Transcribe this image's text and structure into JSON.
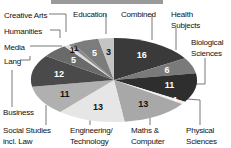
{
  "chart_data": {
    "type": "pie",
    "title": "",
    "categories": [
      "Combined",
      "Health Subjects",
      "Biological Sciences",
      "Physical Sciences",
      "Maths & Computer",
      "Engineering/ Technology",
      "Social Studies incl. Law",
      "Business",
      "Lang",
      "Media",
      "Humanities",
      "Creative Arts",
      "Education"
    ],
    "values": [
      16,
      6,
      11,
      1,
      13,
      13,
      11,
      12,
      5,
      1,
      1,
      5,
      3
    ],
    "colors": [
      "#3a3a3a",
      "#7a7a7a",
      "#2e2e2e",
      "#f0f0f0",
      "#a8a8a8",
      "#e6e6e6",
      "#b0b0b0",
      "#4a4a4a",
      "#6a6a6a",
      "#dcdcdc",
      "#8a8a8a",
      "#7c7c7c",
      "#c4c4c4"
    ],
    "value_label_colors": [
      "#ffffff",
      "#ffffff",
      "#ffffff",
      "#ffffff",
      "#111111",
      "#111111",
      "#111111",
      "#ffffff",
      "#ffffff",
      "#111111",
      "#111111",
      "#ffffff",
      "#111111"
    ],
    "legend_position": "callouts"
  },
  "labels": {
    "combined": "Combined",
    "health_1": "Health",
    "health_2": "Subjects",
    "bio_1": "Biological",
    "bio_2": "Sciences",
    "phys_1": "Physical",
    "phys_2": "Sciences",
    "maths_1": "Maths &",
    "maths_2": "Computer",
    "eng_1": "Engineering/",
    "eng_2": "Technology",
    "social_1": "Social  Studies",
    "social_2": "incl. Law",
    "business": "Business",
    "lang": "Lang",
    "media": "Media",
    "humanities": "Humanities",
    "creative": "Creative Arts",
    "education": "Education"
  }
}
